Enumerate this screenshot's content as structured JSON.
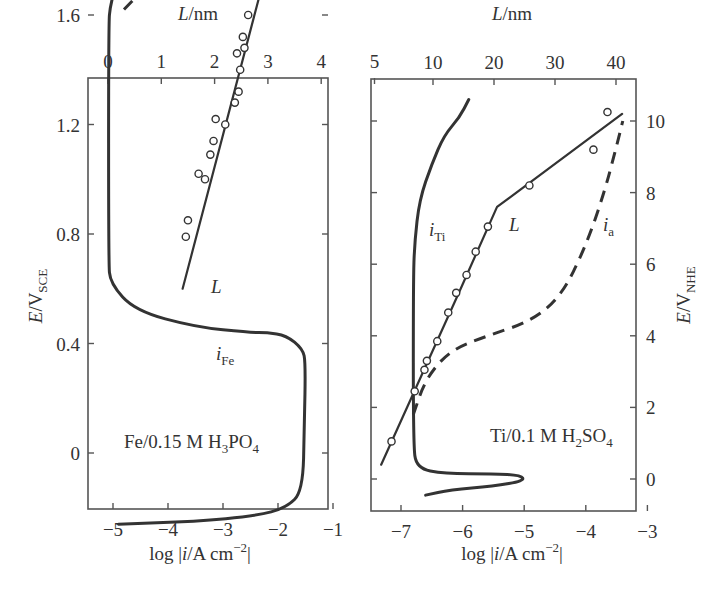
{
  "chart_data": [
    {
      "type": "line",
      "panel": "left",
      "annotation": "Fe/0.15 M H3PO4",
      "annotation_parts": {
        "main": "Fe/0.15 M H",
        "sub1": "3",
        "mid": "PO",
        "sub2": "4"
      },
      "xlabel": "log |i/A cm^-2|",
      "xlabel_parts": {
        "pre": "log |",
        "i": "i",
        "post": "/A cm",
        "sup": "−2",
        "end": "|"
      },
      "x_ticks": [
        "−5",
        "−4",
        "−3",
        "−2",
        "−1"
      ],
      "x_tick_values": [
        -5,
        -4,
        -3,
        -2,
        -1
      ],
      "xlim": [
        -5.7,
        -1
      ],
      "top_xlabel": "L/nm",
      "top_xlabel_parts": {
        "L": "L",
        "unit": "/nm"
      },
      "top_x_ticks": [
        "0",
        "1",
        "2",
        "3",
        "4",
        "5"
      ],
      "top_x_tick_values": [
        0,
        1,
        2,
        3,
        4,
        5
      ],
      "top_xlim": [
        -0.5,
        5.6
      ],
      "ylabel": "E/V_SCE",
      "ylabel_parts": {
        "E": "E",
        "unit": "/V",
        "sub": "SCE"
      },
      "y_ticks": [
        "0",
        "0.4",
        "0.8",
        "1.2",
        "1.6"
      ],
      "y_tick_values": [
        0,
        0.4,
        0.8,
        1.2,
        1.6
      ],
      "ylim": [
        -0.32,
        1.98
      ],
      "series": [
        {
          "name": "i_Fe",
          "label_i": "i",
          "label_sub": "Fe",
          "style": "solid",
          "x": [
            -4.9,
            -3.5,
            -2.4,
            -1.85,
            -1.55,
            -1.52,
            -1.5,
            -1.55,
            -1.85,
            -2.2,
            -2.5,
            -3.5,
            -4.6,
            -5.05,
            -5.08,
            -5.08,
            -5.05,
            -4.85,
            -4.5
          ],
          "y": [
            -0.26,
            -0.25,
            -0.23,
            -0.2,
            -0.14,
            0.1,
            0.33,
            0.38,
            0.43,
            0.44,
            0.44,
            0.46,
            0.52,
            0.62,
            0.7,
            1.56,
            1.64,
            1.77,
            1.83
          ]
        },
        {
          "name": "i_Fe (dashed)",
          "style": "dashed",
          "L_nm": [
            0.3,
            0.6,
            1.2,
            1.8,
            2.4
          ],
          "y": [
            1.62,
            1.68,
            1.74,
            1.79,
            1.84
          ]
        },
        {
          "name": "L",
          "label": "L",
          "style": "solid-fit",
          "axis": "top",
          "L_nm": [
            1.4,
            2.95
          ],
          "y": [
            0.6,
            1.75
          ]
        },
        {
          "name": "L (measured)",
          "style": "markers",
          "axis": "top",
          "L_nm": [
            1.5,
            1.46,
            1.7,
            1.82,
            1.92,
            1.98,
            2.02,
            2.2,
            2.38,
            2.45,
            2.48,
            2.42,
            2.56,
            2.53,
            2.63
          ],
          "y": [
            0.85,
            0.79,
            1.02,
            1.0,
            1.09,
            1.14,
            1.22,
            1.2,
            1.28,
            1.32,
            1.4,
            1.46,
            1.48,
            1.52,
            1.6
          ]
        }
      ]
    },
    {
      "type": "line",
      "panel": "right",
      "annotation": "Ti/0.1 M H2SO4",
      "annotation_parts": {
        "main": "Ti/0.1 M H",
        "sub1": "2",
        "mid": "SO",
        "sub2": "4"
      },
      "xlabel": "log |i/A cm^-2|",
      "xlabel_parts": {
        "pre": "log |",
        "i": "i",
        "post": "/A cm",
        "sup": "−2",
        "end": "|"
      },
      "x_ticks": [
        "−7",
        "−6",
        "−5",
        "−4",
        "−3"
      ],
      "x_tick_values": [
        -7,
        -6,
        -5,
        -4,
        -3
      ],
      "xlim": [
        -7.5,
        -3
      ],
      "top_xlabel": "L/nm",
      "top_xlabel_parts": {
        "L": "L",
        "unit": "/nm"
      },
      "top_x_ticks": [
        "10",
        "20",
        "30",
        "40"
      ],
      "top_x_tick_values": [
        10,
        20,
        30,
        40
      ],
      "top_xlim": [
        0,
        45
      ],
      "ylabel": "E/V_NHE",
      "ylabel_parts": {
        "E": "E",
        "unit": "/V",
        "sub": "NHE"
      },
      "y_ticks": [
        "0",
        "2",
        "4",
        "6",
        "8",
        "10"
      ],
      "y_tick_values": [
        0,
        2,
        4,
        6,
        8,
        10
      ],
      "ylim": [
        -0.95,
        11.0
      ],
      "series": [
        {
          "name": "i_Ti",
          "label_i": "i",
          "label_sub": "Ti",
          "style": "solid",
          "x": [
            -6.6,
            -6.2,
            -5.5,
            -5.0,
            -5.05,
            -5.5,
            -6.3,
            -6.75,
            -6.8,
            -6.8,
            -6.78,
            -6.7,
            -6.5,
            -6.3,
            -6.05,
            -5.9
          ],
          "y": [
            -0.45,
            -0.3,
            -0.2,
            -0.05,
            0.1,
            0.15,
            0.15,
            0.3,
            1.0,
            5.5,
            6.6,
            7.8,
            8.8,
            9.6,
            10.1,
            10.6
          ]
        },
        {
          "name": "i_a",
          "label_i": "i",
          "label_sub": "a",
          "style": "dashed",
          "x": [
            -6.8,
            -6.6,
            -6.2,
            -5.6,
            -4.9,
            -4.4,
            -4.0,
            -3.7,
            -3.5,
            -3.4
          ],
          "y": [
            1.8,
            2.8,
            3.6,
            4.0,
            4.4,
            5.1,
            6.5,
            8.0,
            9.3,
            10.0
          ]
        },
        {
          "name": "L",
          "label": "L",
          "style": "solid-fit",
          "axis": "top",
          "L_nm": [
            1.5,
            14.5,
            20.5,
            41
          ],
          "y": [
            0.4,
            5.3,
            7.6,
            10.2
          ]
        },
        {
          "name": "L (measured)",
          "style": "markers",
          "axis": "top",
          "L_nm": [
            3.2,
            7.0,
            8.6,
            9.0,
            10.7,
            12.5,
            13.8,
            15.5,
            17.0,
            19.0,
            25.8,
            36.3,
            38.6
          ],
          "y": [
            1.05,
            2.45,
            3.05,
            3.3,
            3.85,
            4.65,
            5.2,
            5.7,
            6.35,
            7.05,
            8.2,
            9.2,
            10.25
          ]
        }
      ]
    }
  ]
}
